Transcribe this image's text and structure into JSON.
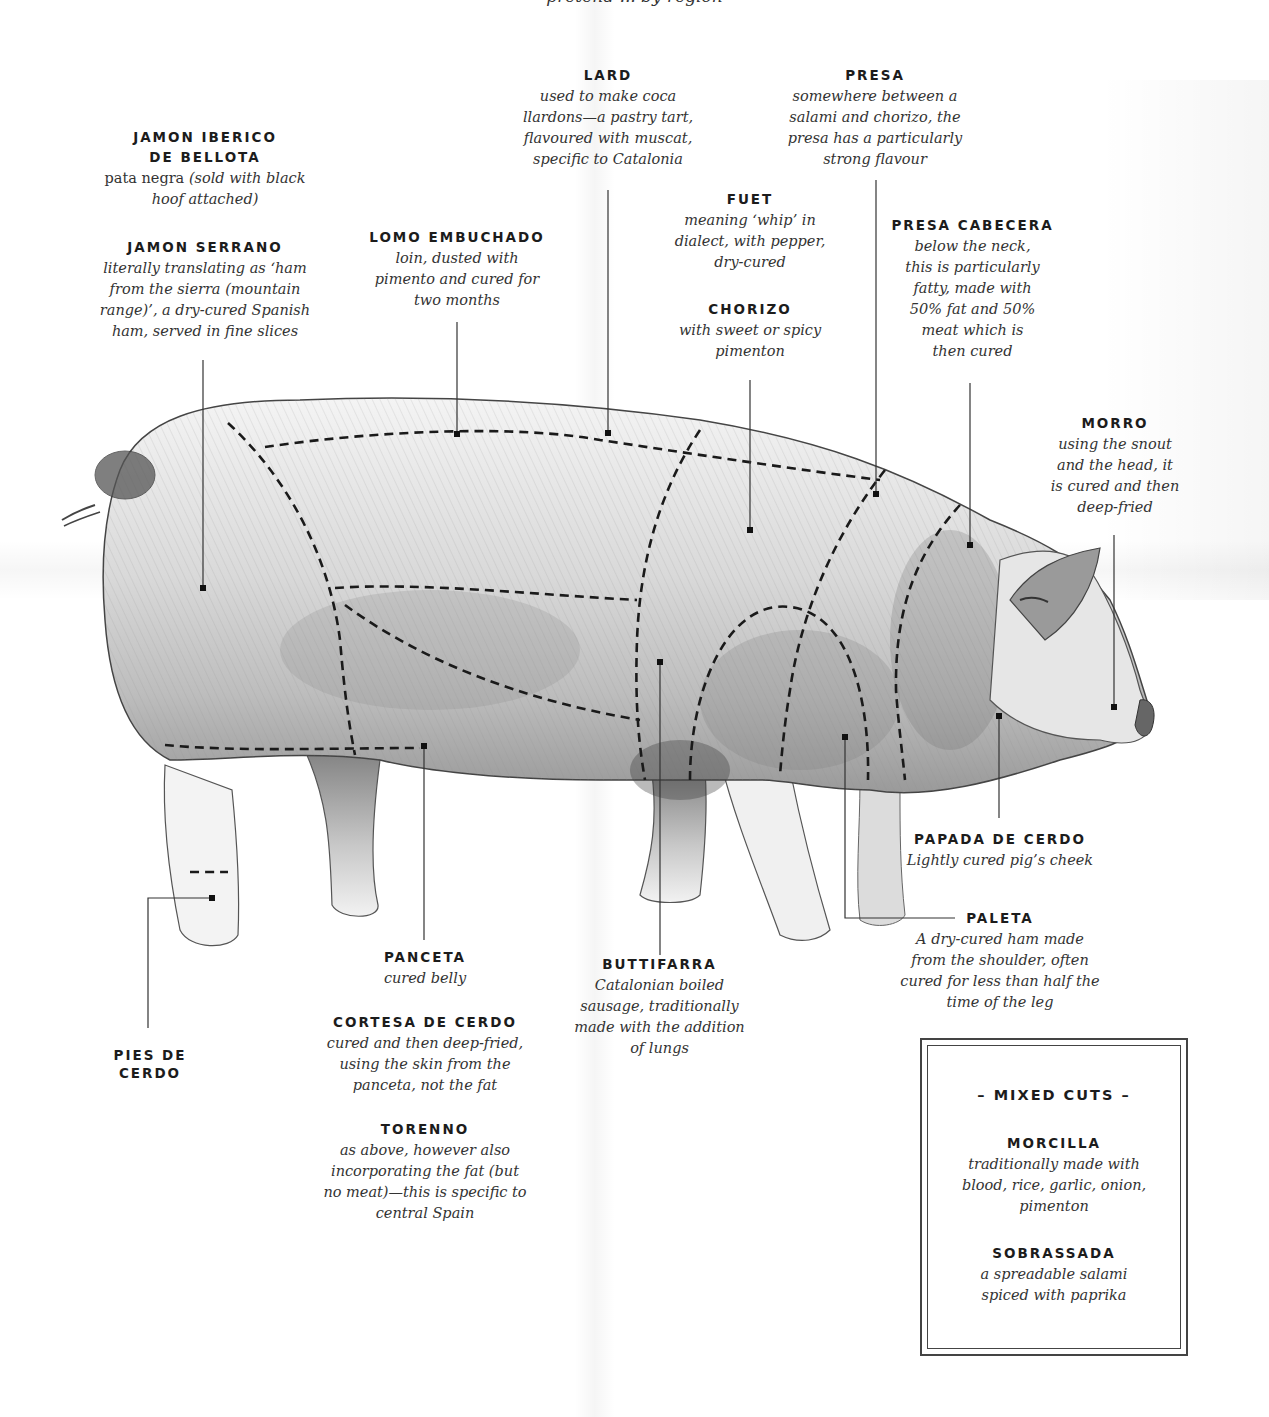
{
  "header": {
    "cut_off_text": "pretend ... by region"
  },
  "cuts": {
    "jamon_iberico": {
      "title_line1": "JAMON IBERICO",
      "title_line2": "DE BELLOTA",
      "desc_upright": "pata negra ",
      "desc_italic": "(sold with black\nhoof attached)"
    },
    "jamon_serrano": {
      "title": "JAMON SERRANO",
      "desc": "literally translating as ‘ham\nfrom the sierra (mountain\nrange)’, a dry-cured Spanish\nham, served in fine slices"
    },
    "lomo": {
      "title": "LOMO EMBUCHADO",
      "desc": "loin, dusted with\npimento and cured for\ntwo months"
    },
    "lard": {
      "title": "LARD",
      "desc": "used to make coca\nllardons—a pastry tart,\nflavoured with muscat,\nspecific to Catalonia"
    },
    "presa": {
      "title": "PRESA",
      "desc": "somewhere between a\nsalami and chorizo, the\npresa has a particularly\nstrong flavour"
    },
    "fuet": {
      "title": "FUET",
      "desc": "meaning ‘whip’ in\ndialect, with pepper,\ndry-cured"
    },
    "chorizo": {
      "title": "CHORIZO",
      "desc": "with sweet or spicy\npimenton"
    },
    "presa_cabecera": {
      "title": "PRESA CABECERA",
      "desc": "below the neck,\nthis is particularly\nfatty, made with\n50% fat and 50%\nmeat which is\nthen cured"
    },
    "morro": {
      "title": "MORRO",
      "desc": "using the snout\nand the head, it\nis cured and then\ndeep-fried"
    },
    "papada": {
      "title": "PAPADA DE CERDO",
      "desc": "Lightly cured pig’s cheek"
    },
    "paleta": {
      "title": "PALETA",
      "desc": "A dry-cured ham made\nfrom the shoulder, often\ncured for less than half the\ntime of the leg"
    },
    "buttifarra": {
      "title": "BUTTIFARRA",
      "desc": "Catalonian boiled\nsausage, traditionally\nmade with the addition\nof lungs"
    },
    "panceta": {
      "title": "PANCETA",
      "desc": "cured belly"
    },
    "cortesa": {
      "title": "CORTESA DE CERDO",
      "desc": "cured and then deep-fried,\nusing the skin from the\npanceta, not the fat"
    },
    "torenno": {
      "title": "TORENNO",
      "desc": "as above, however also\nincorporating the fat (but\nno meat)—this is specific to\ncentral Spain"
    },
    "pies": {
      "title": "PIES DE\nCERDO"
    }
  },
  "mixed_cuts": {
    "heading": "– MIXED CUTS –",
    "items": [
      {
        "title": "MORCILLA",
        "desc": "traditionally made with\nblood, rice, garlic, onion,\npimenton"
      },
      {
        "title": "SOBRASSADA",
        "desc": "a spreadable salami\nspiced with paprika"
      }
    ]
  },
  "colors": {
    "ink": "#1c1c1c",
    "pencil": "#555555",
    "dash": "#1a1a1a",
    "paper": "#ffffff"
  }
}
